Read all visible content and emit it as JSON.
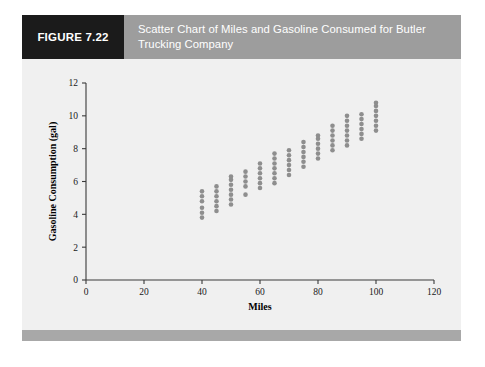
{
  "figure": {
    "tag_label": "FIGURE 7.22",
    "caption": "Scatter Chart of Miles and Gasoline Consumed for Butler Trucking Company",
    "tag_bg_color": "#1b1b1b",
    "caption_bg_color": "#9d9d9d",
    "panel_bg_color": "#f0f0f0",
    "footer_bar_color": "#a8a8a8"
  },
  "chart_data": {
    "type": "scatter",
    "title": "Scatter Chart of Miles and Gasoline Consumed for Butler Trucking Company",
    "xlabel": "Miles",
    "ylabel": "Gasoline Consumption (gal)",
    "xlim": [
      0,
      120
    ],
    "ylim": [
      0,
      12
    ],
    "xticks": [
      0,
      20,
      40,
      60,
      80,
      100,
      120
    ],
    "yticks": [
      0,
      2,
      4,
      6,
      8,
      10,
      12
    ],
    "xtick_labels": [
      "0",
      "20",
      "40",
      "60",
      "80",
      "100",
      "120"
    ],
    "ytick_labels": [
      "0",
      "2",
      "4",
      "6",
      "8",
      "10",
      "12"
    ],
    "grid": false,
    "legend": null,
    "marker_color": "#8e8e8e",
    "marker_radius_px": 2.3,
    "series": [
      {
        "name": "Observations",
        "columns": [
          {
            "x": 40,
            "y": [
              3.8,
              4.1,
              4.4,
              4.8,
              5.1,
              5.4
            ]
          },
          {
            "x": 45,
            "y": [
              4.2,
              4.5,
              4.8,
              5.1,
              5.4,
              5.7
            ]
          },
          {
            "x": 50,
            "y": [
              4.6,
              4.9,
              5.2,
              5.5,
              5.8,
              6.1,
              6.3
            ]
          },
          {
            "x": 55,
            "y": [
              5.2,
              5.7,
              6.0,
              6.3,
              6.6
            ]
          },
          {
            "x": 60,
            "y": [
              5.6,
              5.9,
              6.2,
              6.5,
              6.8,
              7.1
            ]
          },
          {
            "x": 65,
            "y": [
              5.9,
              6.2,
              6.5,
              6.8,
              7.1,
              7.4,
              7.7
            ]
          },
          {
            "x": 70,
            "y": [
              6.4,
              6.7,
              7.0,
              7.3,
              7.6,
              7.9
            ]
          },
          {
            "x": 75,
            "y": [
              6.9,
              7.2,
              7.5,
              7.8,
              8.1,
              8.4
            ]
          },
          {
            "x": 80,
            "y": [
              7.4,
              7.7,
              8.0,
              8.3,
              8.6,
              8.8
            ]
          },
          {
            "x": 85,
            "y": [
              7.9,
              8.2,
              8.5,
              8.8,
              9.1,
              9.4
            ]
          },
          {
            "x": 90,
            "y": [
              8.2,
              8.5,
              8.8,
              9.1,
              9.4,
              9.7,
              10.0
            ]
          },
          {
            "x": 95,
            "y": [
              8.6,
              8.9,
              9.2,
              9.5,
              9.8,
              10.1
            ]
          },
          {
            "x": 100,
            "y": [
              9.1,
              9.4,
              9.7,
              10.0,
              10.3,
              10.6,
              10.8
            ]
          }
        ]
      }
    ]
  }
}
